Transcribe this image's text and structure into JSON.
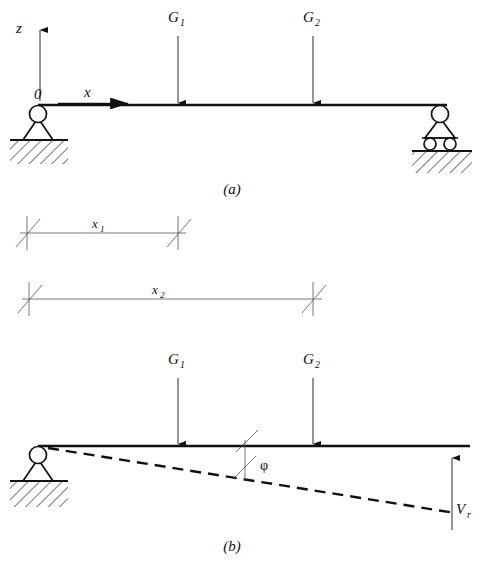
{
  "figure": {
    "panels": [
      {
        "caption": "(a)",
        "caption_x": 232,
        "caption_y": 194,
        "description": "Beam on pin support at left and roller support at right, loaded by G1 and G2",
        "axes": {
          "vertical_label": "z",
          "horizontal_label": "x",
          "origin_label": "0"
        },
        "loads": [
          {
            "label": "G",
            "sub": "1",
            "x": 178
          },
          {
            "label": "G",
            "sub": "2",
            "x": 313
          }
        ],
        "supports": [
          {
            "type": "pin-support",
            "x": 38
          },
          {
            "type": "roller-support",
            "x": 440
          }
        ]
      },
      {
        "caption": "(b)",
        "caption_x": 232,
        "caption_y": 551,
        "description": "Beam with rotated dashed reference line, rotation angle phi and end reaction Vr",
        "loads": [
          {
            "label": "G",
            "sub": "1",
            "x": 178
          },
          {
            "label": "G",
            "sub": "2",
            "x": 313
          }
        ],
        "angle_label": "φ",
        "reaction_label": "V",
        "reaction_sub": "r",
        "supports": [
          {
            "type": "pin-support",
            "x": 38
          }
        ]
      }
    ],
    "dimensions": [
      {
        "label": "x",
        "sub": "1",
        "x_start": 27,
        "x_end": 178,
        "y": 233
      },
      {
        "label": "x",
        "sub": "2",
        "x_start": 29,
        "x_end": 313,
        "y": 299
      }
    ],
    "colors": {
      "ink": "#111111",
      "paper": "#ffffff",
      "hatch": "#333333",
      "thin_line": "#555555"
    }
  }
}
